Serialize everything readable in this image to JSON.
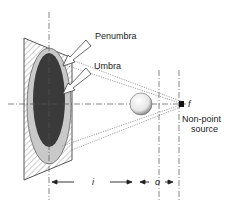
{
  "diagram": {
    "labels": {
      "penumbra": "Penumbra",
      "umbra": "Umbra",
      "focal": "f",
      "source_line1": "Non-point",
      "source_line2": "source",
      "dist_image": "i",
      "dist_object": "o"
    },
    "colors": {
      "umbra": "#3a3a3a",
      "penumbra": "#c9c9c9",
      "plate_hatch": "#888888",
      "lines": "#555555",
      "source": "#111111"
    }
  }
}
